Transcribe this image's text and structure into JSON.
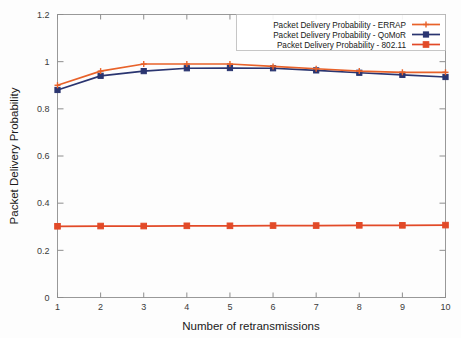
{
  "chart_data": {
    "type": "line",
    "title": "",
    "xlabel": "Number of retransmissions",
    "ylabel": "Packet Delivery Probability",
    "x": [
      1,
      2,
      3,
      4,
      5,
      6,
      7,
      8,
      9,
      10
    ],
    "xlim": [
      1,
      10
    ],
    "ylim": [
      0,
      1.2
    ],
    "xticks": [
      "1",
      "2",
      "3",
      "4",
      "5",
      "6",
      "7",
      "8",
      "9",
      "10"
    ],
    "yticks": [
      "0",
      "0.2",
      "0.4",
      "0.6",
      "0.8",
      "1",
      "1.2"
    ],
    "ytick_values": [
      0,
      0.2,
      0.4,
      0.6,
      0.8,
      1,
      1.2
    ],
    "grid": false,
    "legend_position": "top-right",
    "series": [
      {
        "name": "Packet Delivery Probability - ERRAP",
        "color": "#e8622a",
        "marker": "plus",
        "values": [
          0.9,
          0.96,
          0.99,
          0.99,
          0.99,
          0.98,
          0.97,
          0.96,
          0.955,
          0.955
        ]
      },
      {
        "name": "Packet Delivery Probability - QoMoR",
        "color": "#2a3570",
        "marker": "square",
        "values": [
          0.88,
          0.94,
          0.96,
          0.972,
          0.973,
          0.972,
          0.963,
          0.953,
          0.944,
          0.935
        ]
      },
      {
        "name": "Packet Delivery Probability - 802.11",
        "color": "#e24a28",
        "marker": "filled-square",
        "values": [
          0.302,
          0.303,
          0.303,
          0.304,
          0.304,
          0.305,
          0.305,
          0.306,
          0.306,
          0.307
        ]
      }
    ]
  },
  "axes": {
    "x_title": "Number of retransmissions",
    "y_title": "Packet Delivery Probability"
  },
  "legend": {
    "entries": [
      "Packet Delivery Probability - ERRAP",
      "Packet Delivery Probability - QoMoR",
      "Packet Delivery Probability - 802.11"
    ]
  },
  "colors": {
    "errap": "#e8622a",
    "qomor": "#2a3570",
    "ieee80211": "#e24a28",
    "frame": "#999999",
    "text": "#202020",
    "background": "#fdfdfd"
  }
}
